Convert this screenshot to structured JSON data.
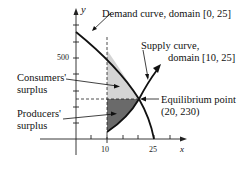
{
  "diagram": {
    "axes": {
      "x_label": "x",
      "y_label": "y",
      "x_ticks": [
        {
          "value": 10,
          "label": "10"
        },
        {
          "value": 25,
          "label": "25"
        }
      ],
      "y_ticks": [
        {
          "value": 500,
          "label": "500"
        }
      ]
    },
    "labels": {
      "demand": "Demand curve, domain [0, 25]",
      "supply_line1": "Supply curve,",
      "supply_line2": "domain [10, 25]",
      "consumers_line1": "Consumers'",
      "consumers_line2": "surplus",
      "producers_line1": "Producers'",
      "producers_line2": "surplus",
      "equilibrium_line1": "Equilibrium point",
      "equilibrium_line2": "(20, 230)"
    },
    "equilibrium": {
      "x": 20,
      "y": 230
    },
    "colors": {
      "consumers_surplus_fill": "#d4d4d4",
      "producers_surplus_fill": "#6a6a6a",
      "curve": "#111111"
    }
  }
}
